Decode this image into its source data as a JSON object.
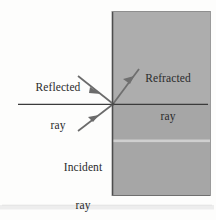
{
  "figure": {
    "background_color": "#fdfdfc",
    "medium": {
      "name": "denser-medium-block",
      "fill_color": "#a9a9a9",
      "edge_color": "#4a4a4a",
      "x": 112,
      "y": 11,
      "width": 99,
      "height": 185
    },
    "boundary_line": {
      "name": "interface-line",
      "color": "#3b3b3b",
      "x1": 18,
      "y1": 104,
      "x2": 208,
      "y2": 104
    },
    "incidence_point": {
      "x": 113,
      "y": 104
    },
    "rays": [
      {
        "id": "reflected",
        "label_line1": "Reflected",
        "label_line2": "ray",
        "color": "#6b6b6b",
        "x1": 78,
        "y1": 76,
        "x2": 112,
        "y2": 103,
        "arrow_t": 0.62,
        "direction": "toward-boundary"
      },
      {
        "id": "refracted",
        "label_line1": "Refracted",
        "label_line2": "ray",
        "color": "#6f6f6f",
        "x1": 113,
        "y1": 104,
        "x2": 139,
        "y2": 69,
        "arrow_t": 0.7,
        "direction": "away-from-boundary"
      },
      {
        "id": "incident",
        "label_line1": "Incident",
        "label_line2": "ray",
        "color": "#6b6b6b",
        "x1": 78,
        "y1": 131,
        "x2": 112,
        "y2": 105,
        "arrow_t": 0.52,
        "direction": "toward-boundary"
      }
    ],
    "shading_band": {
      "name": "paper-seam-band",
      "color": "#d4d4d4",
      "y": 141
    },
    "bottom_strip": {
      "name": "page-edge-strip",
      "color": "#ececec",
      "y": 205,
      "height": 5
    }
  }
}
